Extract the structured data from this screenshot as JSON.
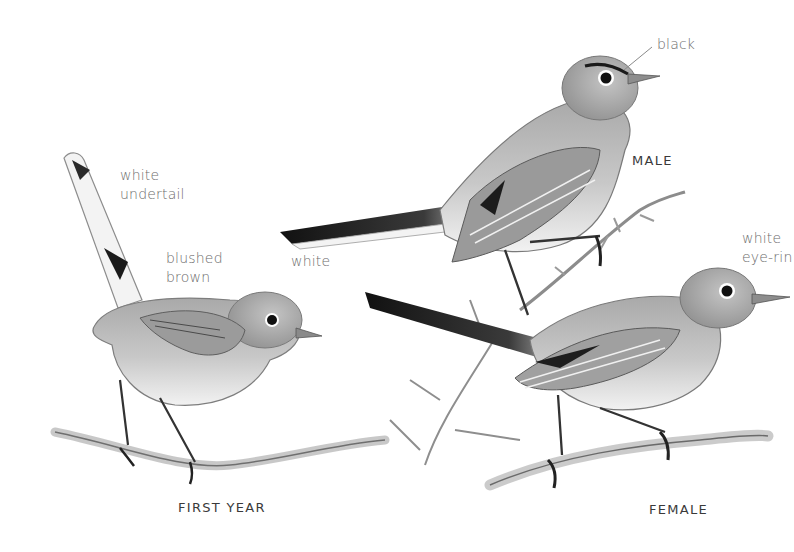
{
  "plate": {
    "subjects": [
      {
        "id": "first_year",
        "caption": "FIRST YEAR"
      },
      {
        "id": "male",
        "caption": "MALE"
      },
      {
        "id": "female",
        "caption": "FEMALE"
      }
    ],
    "annotations": {
      "white_undertail": "white\nundertail",
      "blushed_brown": "blushed\nbrown",
      "white_tail_edge": "white",
      "black_brow": "black",
      "white_eye_ring": "white\neye-rin"
    },
    "colors": {
      "background": "#ffffff",
      "label_text": "#6d6d6d",
      "caption_text": "#3a3a3a",
      "pencil_dark": "#1c1c1c",
      "pencil_mid": "#8a8a8a",
      "pencil_light": "#cfcfcf"
    }
  }
}
